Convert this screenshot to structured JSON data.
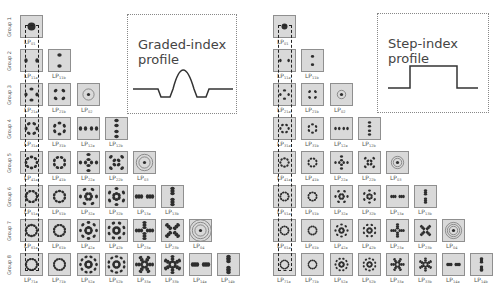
{
  "figure": {
    "panels": [
      {
        "id": "graded",
        "profile_title_line1": "Graded-index",
        "profile_title_line2": "profile",
        "profile_shape": "graded-index",
        "groups": [
          {
            "label": "Group 1",
            "modes": [
              {
                "base": "LP",
                "sub": "01"
              }
            ]
          },
          {
            "label": "Group 2",
            "modes": [
              {
                "base": "LP",
                "sub": "11a"
              },
              {
                "base": "LP",
                "sub": "11b"
              }
            ]
          },
          {
            "label": "Group 3",
            "modes": [
              {
                "base": "LP",
                "sub": "21a"
              },
              {
                "base": "LP",
                "sub": "21b"
              },
              {
                "base": "LP",
                "sub": "02"
              }
            ]
          },
          {
            "label": "Group 4",
            "modes": [
              {
                "base": "LP",
                "sub": "31a"
              },
              {
                "base": "LP",
                "sub": "31b"
              },
              {
                "base": "LP",
                "sub": "12a"
              },
              {
                "base": "LP",
                "sub": "12b"
              }
            ]
          },
          {
            "label": "Group 5",
            "modes": [
              {
                "base": "LP",
                "sub": "41a"
              },
              {
                "base": "LP",
                "sub": "41b"
              },
              {
                "base": "LP",
                "sub": "22a"
              },
              {
                "base": "LP",
                "sub": "22b"
              },
              {
                "base": "LP",
                "sub": "03"
              }
            ]
          },
          {
            "label": "Group 6",
            "modes": [
              {
                "base": "LP",
                "sub": "51a"
              },
              {
                "base": "LP",
                "sub": "51b"
              },
              {
                "base": "LP",
                "sub": "32a"
              },
              {
                "base": "LP",
                "sub": "32b"
              },
              {
                "base": "LP",
                "sub": "13a"
              },
              {
                "base": "LP",
                "sub": "13b"
              }
            ]
          },
          {
            "label": "Group 7",
            "modes": [
              {
                "base": "LP",
                "sub": "61a"
              },
              {
                "base": "LP",
                "sub": "61b"
              },
              {
                "base": "LP",
                "sub": "42a"
              },
              {
                "base": "LP",
                "sub": "42b"
              },
              {
                "base": "LP",
                "sub": "23a"
              },
              {
                "base": "LP",
                "sub": "23b"
              },
              {
                "base": "LP",
                "sub": "04"
              }
            ]
          },
          {
            "label": "Group 8",
            "modes": [
              {
                "base": "LP",
                "sub": "71a"
              },
              {
                "base": "LP",
                "sub": "71b"
              },
              {
                "base": "LP",
                "sub": "52a"
              },
              {
                "base": "LP",
                "sub": "52b"
              },
              {
                "base": "LP",
                "sub": "33a"
              },
              {
                "base": "LP",
                "sub": "33b"
              },
              {
                "base": "LP",
                "sub": "14a"
              },
              {
                "base": "LP",
                "sub": "14b"
              }
            ]
          }
        ]
      },
      {
        "id": "step",
        "profile_title_line1": "Step-index",
        "profile_title_line2": "profile",
        "profile_shape": "step-index",
        "groups": [
          {
            "label": "",
            "modes": [
              {
                "base": "LP",
                "sub": "01"
              }
            ]
          },
          {
            "label": "",
            "modes": [
              {
                "base": "LP",
                "sub": "11a"
              },
              {
                "base": "LP",
                "sub": "11b"
              }
            ]
          },
          {
            "label": "",
            "modes": [
              {
                "base": "LP",
                "sub": "21a"
              },
              {
                "base": "LP",
                "sub": "21b"
              },
              {
                "base": "LP",
                "sub": "02"
              }
            ]
          },
          {
            "label": "",
            "modes": [
              {
                "base": "LP",
                "sub": "31a"
              },
              {
                "base": "LP",
                "sub": "31b"
              },
              {
                "base": "LP",
                "sub": "12a"
              },
              {
                "base": "LP",
                "sub": "12b"
              }
            ]
          },
          {
            "label": "",
            "modes": [
              {
                "base": "LP",
                "sub": "41a"
              },
              {
                "base": "LP",
                "sub": "41b"
              },
              {
                "base": "LP",
                "sub": "22a"
              },
              {
                "base": "LP",
                "sub": "22b"
              },
              {
                "base": "LP",
                "sub": "03"
              }
            ]
          },
          {
            "label": "",
            "modes": [
              {
                "base": "LP",
                "sub": "51a"
              },
              {
                "base": "LP",
                "sub": "51b"
              },
              {
                "base": "LP",
                "sub": "32a"
              },
              {
                "base": "LP",
                "sub": "32b"
              },
              {
                "base": "LP",
                "sub": "13a"
              },
              {
                "base": "LP",
                "sub": "13b"
              }
            ]
          },
          {
            "label": "",
            "modes": [
              {
                "base": "LP",
                "sub": "61a"
              },
              {
                "base": "LP",
                "sub": "61b"
              },
              {
                "base": "LP",
                "sub": "42a"
              },
              {
                "base": "LP",
                "sub": "42b"
              },
              {
                "base": "LP",
                "sub": "23a"
              },
              {
                "base": "LP",
                "sub": "23b"
              },
              {
                "base": "LP",
                "sub": "04"
              }
            ]
          },
          {
            "label": "",
            "modes": [
              {
                "base": "LP",
                "sub": "71a"
              },
              {
                "base": "LP",
                "sub": "71b"
              },
              {
                "base": "LP",
                "sub": "52a"
              },
              {
                "base": "LP",
                "sub": "52b"
              },
              {
                "base": "LP",
                "sub": "33a"
              },
              {
                "base": "LP",
                "sub": "33b"
              },
              {
                "base": "LP",
                "sub": "14a"
              },
              {
                "base": "LP",
                "sub": "14b"
              }
            ]
          }
        ]
      }
    ],
    "colors": {
      "tile_bg": "#d9d9d9",
      "tile_border": "#8f8f8f",
      "lobe": "#2e2e2e",
      "profile_line": "#333333",
      "dashed_box": "#222222"
    }
  }
}
